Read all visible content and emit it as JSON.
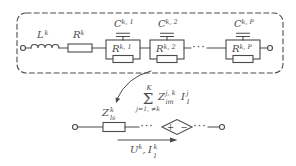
{
  "figure": {
    "background": "#ffffff",
    "ink": "#4a4a4a",
    "top": {
      "inductor": {
        "base": "L",
        "sup": "k"
      },
      "resistor": {
        "base": "R",
        "sup": "k"
      },
      "cells": [
        {
          "cap": {
            "base": "C",
            "sup": "k, 1"
          },
          "res": {
            "base": "R",
            "sup": "k, 1"
          }
        },
        {
          "cap": {
            "base": "C",
            "sup": "k, 2"
          },
          "res": {
            "base": "R",
            "sup": "k, 2"
          }
        },
        {
          "cap": {
            "base": "C",
            "sup": "k, P"
          },
          "res": {
            "base": "R",
            "sup": "k, P"
          }
        }
      ],
      "ellipsis": "···"
    },
    "bottom": {
      "impedance": {
        "base": "Z",
        "sup": "k",
        "sub": "ls"
      },
      "sum": {
        "upper": "K",
        "sigma": "Σ",
        "lower": "j=1, ≠k",
        "mutual": {
          "base": "Z",
          "sup": "j, k",
          "sub": "im"
        },
        "current": {
          "base": "I",
          "sup": "j",
          "sub": "1"
        }
      },
      "source": {
        "plus": "+",
        "minus": "−"
      },
      "ellipsis_left": "···",
      "ellipsis_right": "···",
      "flow": {
        "u_base": "U",
        "u_sup": "k",
        "sep": ",",
        "i_base": "I",
        "i_sup": "k",
        "i_sub": "1"
      }
    }
  }
}
